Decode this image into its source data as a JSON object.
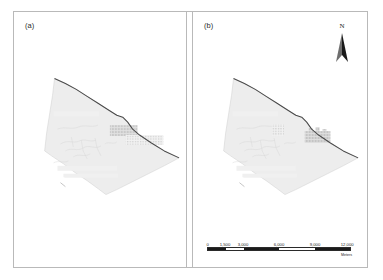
{
  "figure": {
    "type": "two-panel-map-figure",
    "background_color": "#ffffff",
    "frame_color": "#b9b9b9"
  },
  "panels": [
    {
      "id": "a",
      "label": "(a)",
      "has_north_arrow": false,
      "has_scalebar": false,
      "patches": [
        {
          "name": "dense-grid-patch",
          "style": "grid-hatch-dense",
          "color": "#c9c9c9"
        },
        {
          "name": "sparse-dot-patch",
          "style": "dotted-fine",
          "color": "#d2d2d2"
        }
      ]
    },
    {
      "id": "b",
      "label": "(b)",
      "has_north_arrow": true,
      "has_scalebar": true,
      "patches": [
        {
          "name": "small-dot-patch",
          "style": "dotted-fine",
          "color": "#cfcfcf"
        },
        {
          "name": "stepped-grid-patch",
          "style": "grid-hatch-dense",
          "color": "#c4c4c4"
        }
      ]
    }
  ],
  "map_layers": {
    "study_area_fill": "#ededed",
    "study_area_stroke": "#cccccc",
    "coastline_color": "#4a4a4a",
    "hydrology_color": "#cfcfcf"
  },
  "north_arrow": {
    "name": "north-arrow",
    "letter": "N",
    "color": "#1a1a1a"
  },
  "scalebar": {
    "name": "scale-bar",
    "units_label": "Meters",
    "ticks": [
      "0",
      "1,500",
      "3,000",
      "6,000",
      "9,000",
      "12,000"
    ],
    "tick_positions_pct": [
      0,
      12.5,
      25,
      50,
      75,
      100
    ],
    "segments": [
      {
        "fill": "#1a1a1a",
        "width_pct": 12.5
      },
      {
        "fill": "#ffffff",
        "width_pct": 12.5
      },
      {
        "fill": "#1a1a1a",
        "width_pct": 25
      },
      {
        "fill": "#ffffff",
        "width_pct": 25
      },
      {
        "fill": "#1a1a1a",
        "width_pct": 25
      }
    ]
  }
}
